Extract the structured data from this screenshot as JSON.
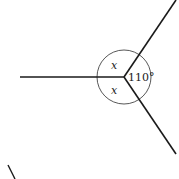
{
  "diagram": {
    "type": "angles-at-a-point",
    "center": {
      "x": 124,
      "y": 77
    },
    "circle_radius": 27,
    "line_color": "#1a1a1a",
    "circle_color": "#444444",
    "rays": [
      {
        "name": "left-ray",
        "to": {
          "x": 20,
          "y": 77
        }
      },
      {
        "name": "upper-right-ray",
        "to": {
          "x": 176,
          "y": 0
        }
      },
      {
        "name": "lower-right-ray",
        "to": {
          "x": 176,
          "y": 154
        }
      }
    ],
    "labels": {
      "upper_angle": "x",
      "lower_angle": "x",
      "right_angle": "110°"
    },
    "fragment": {
      "from": {
        "x": 8,
        "y": 165
      },
      "to": {
        "x": 15,
        "y": 179
      }
    }
  }
}
